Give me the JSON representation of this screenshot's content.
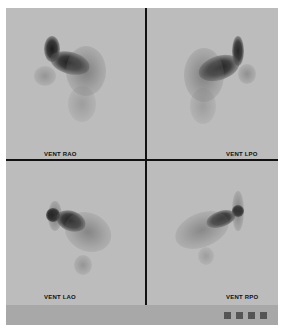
{
  "panels": [
    {
      "id": "rao",
      "label": "VENT RAO"
    },
    {
      "id": "lpo",
      "label": "VENT LPO"
    },
    {
      "id": "lao",
      "label": "VENT LAO"
    },
    {
      "id": "rpo",
      "label": "VENT RPO"
    }
  ],
  "bottom_bar": {
    "indicators": [
      "square-1",
      "square-2",
      "square-3",
      "square-4"
    ]
  },
  "colors": {
    "background": "#bcbcbc",
    "divider": "#111111",
    "strip": "#a8a8a8"
  }
}
